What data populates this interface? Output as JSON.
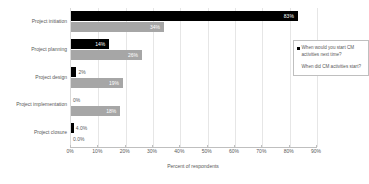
{
  "chart_data": {
    "type": "bar",
    "orientation": "horizontal",
    "title": "",
    "xlabel": "Percent of respondents",
    "ylabel": "",
    "xlim": [
      0,
      90
    ],
    "grid": true,
    "legend_position": "inside-top-right",
    "categories": [
      "Project initiation",
      "Project planning",
      "Project design",
      "Project implementation",
      "Project closure"
    ],
    "xticks": [
      "0%",
      "10%",
      "20%",
      "30%",
      "40%",
      "50%",
      "60%",
      "70%",
      "80%",
      "90%"
    ],
    "xtick_values": [
      0,
      10,
      20,
      30,
      40,
      50,
      60,
      70,
      80,
      90
    ],
    "series": [
      {
        "name": "When would you start CM activities next time?",
        "color": "#000000",
        "values": [
          83,
          14,
          2,
          0,
          1
        ],
        "labels": [
          "83%",
          "14%",
          "2%",
          "0%",
          "4.0%"
        ]
      },
      {
        "name": "When did CM activities start?",
        "color": "#a6a6a6",
        "values": [
          34,
          26,
          19,
          18,
          0
        ],
        "labels": [
          "34%",
          "26%",
          "19%",
          "18%",
          "0.0%"
        ]
      }
    ]
  },
  "legend": {
    "entries": [
      {
        "label": "When would you start CM activities next time?",
        "marker": "square-black"
      },
      {
        "label": "When did CM activities start?",
        "marker": "none"
      }
    ]
  }
}
